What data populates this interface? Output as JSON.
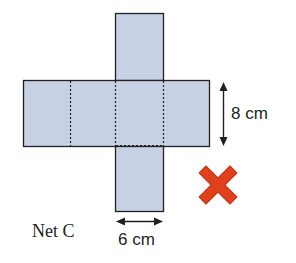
{
  "diagram": {
    "net_label": "Net C",
    "height_label": "8 cm",
    "width_label": "6 cm",
    "result_icon": "cross-icon",
    "colors": {
      "face_fill": "#c6d1e4",
      "outline": "#231f20",
      "cross": "#e0401c"
    }
  }
}
